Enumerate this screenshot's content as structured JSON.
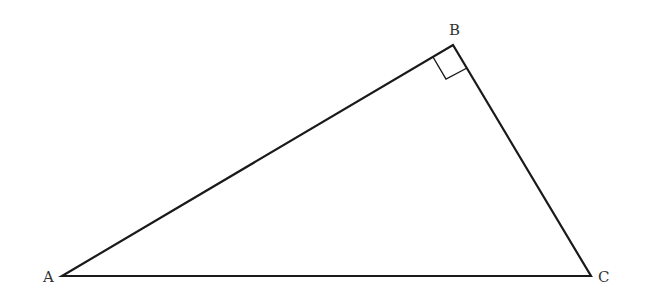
{
  "diagram": {
    "type": "right-triangle",
    "stroke_color": "#1a1a1a",
    "vertices": {
      "A": {
        "label": "A",
        "x": 62,
        "y": 276
      },
      "B": {
        "label": "B",
        "x": 453,
        "y": 45
      },
      "C": {
        "label": "C",
        "x": 591,
        "y": 276
      }
    },
    "right_angle_at": "B",
    "sides": [
      "AB",
      "BC",
      "CA"
    ]
  }
}
